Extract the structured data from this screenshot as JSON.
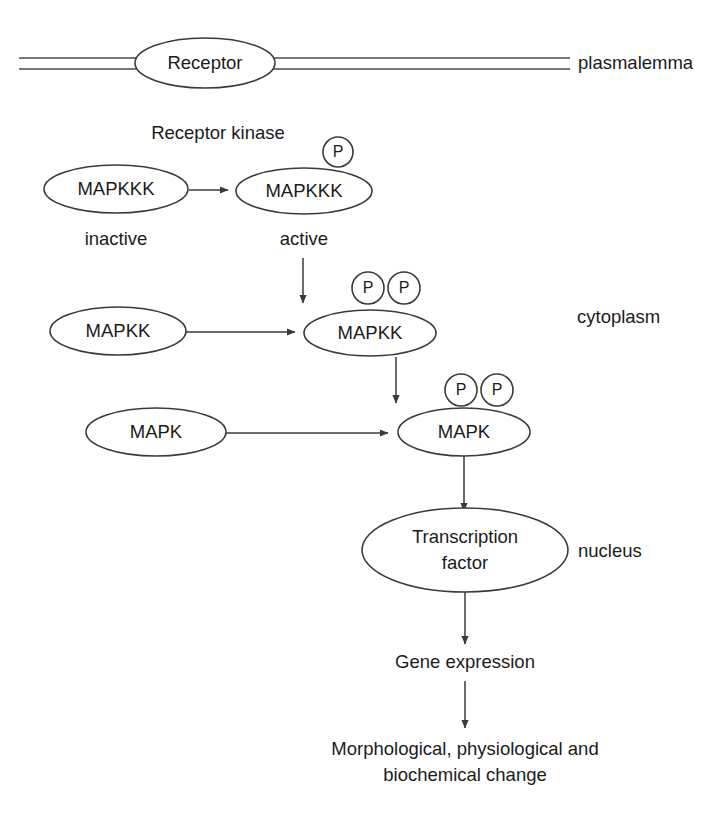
{
  "diagram": {
    "background_color": "#ffffff",
    "stroke_color": "#3a3a3a",
    "text_color": "#1b1b1b"
  },
  "membrane": {
    "label": "plasmalemma",
    "receptor_label": "Receptor"
  },
  "compartments": {
    "cytoplasm_label": "cytoplasm",
    "nucleus_label": "nucleus"
  },
  "kinase": {
    "receptor_kinase_label": "Receptor kinase"
  },
  "nodes": {
    "mapkkk_inactive": "MAPKKK",
    "mapkkk_active": "MAPKKK",
    "mapkk_inactive": "MAPKK",
    "mapkk_active": "MAPKK",
    "mapk_inactive": "MAPK",
    "mapk_active": "MAPK",
    "transcription_factor_line1": "Transcription",
    "transcription_factor_line2": "factor"
  },
  "states": {
    "inactive_label": "inactive",
    "active_label": "active"
  },
  "phosphate": {
    "symbol": "P",
    "mapkkk_count": 1,
    "mapkk_count": 2,
    "mapk_count": 2
  },
  "outcomes": {
    "gene_expression": "Gene expression",
    "change_line1": "Morphological, physiological and",
    "change_line2": "biochemical change"
  }
}
